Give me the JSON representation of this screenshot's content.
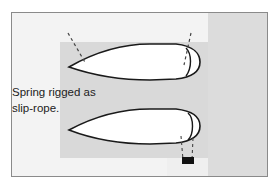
{
  "figure": {
    "caption_line1": "Spring rigged as",
    "caption_line2": "slip-rope.",
    "colors": {
      "frame_border": "#8a8a8a",
      "background": "#f3f3f3",
      "water": "#d9d9d9",
      "hull_fill": "#ffffff",
      "hull_outline": "#1a1a1a",
      "rope": "#444444",
      "fender": "#111111"
    },
    "elements": [
      {
        "name": "upper-boat",
        "type": "hull-outline"
      },
      {
        "name": "lower-boat",
        "type": "hull-outline"
      },
      {
        "name": "bow-line-upper",
        "type": "dashed-rope"
      },
      {
        "name": "stern-line-upper",
        "type": "dashed-rope"
      },
      {
        "name": "slip-rope-spring",
        "type": "dashed-rope"
      },
      {
        "name": "cleat",
        "type": "fitting"
      }
    ]
  }
}
